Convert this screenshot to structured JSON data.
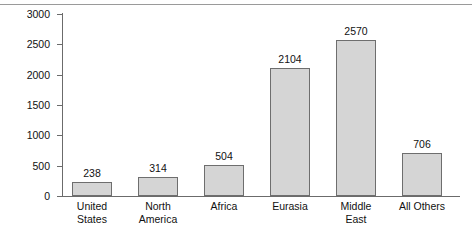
{
  "chart_data": {
    "type": "bar",
    "title": "",
    "xlabel": "",
    "ylabel": "Trillion Cubic Feet",
    "categories": [
      "United States",
      "North America",
      "Africa",
      "Eurasia",
      "Middle East",
      "All Others"
    ],
    "category_lines": [
      [
        "United",
        "States"
      ],
      [
        "North",
        "America"
      ],
      [
        "Africa"
      ],
      [
        "Eurasia"
      ],
      [
        "Middle",
        "East"
      ],
      [
        "All Others"
      ]
    ],
    "values": [
      238,
      314,
      504,
      2104,
      2570,
      706
    ],
    "value_labels": [
      "238",
      "314",
      "504",
      "2104",
      "2570",
      "706"
    ],
    "ylim": [
      0,
      3000
    ],
    "ytick_values": [
      0,
      500,
      1000,
      1500,
      2000,
      2500,
      3000
    ],
    "ytick_labels": [
      "0",
      "500",
      "1000",
      "1500",
      "2000",
      "2500",
      "3000"
    ],
    "grid": false,
    "legend": null,
    "bar_fill_color": "#d5d5d5",
    "bar_border_color": "#6e6e6e",
    "axis_color": "#6b6b6b",
    "background_color": "#ffffff",
    "top_rule_color": "#9a9a9a"
  }
}
